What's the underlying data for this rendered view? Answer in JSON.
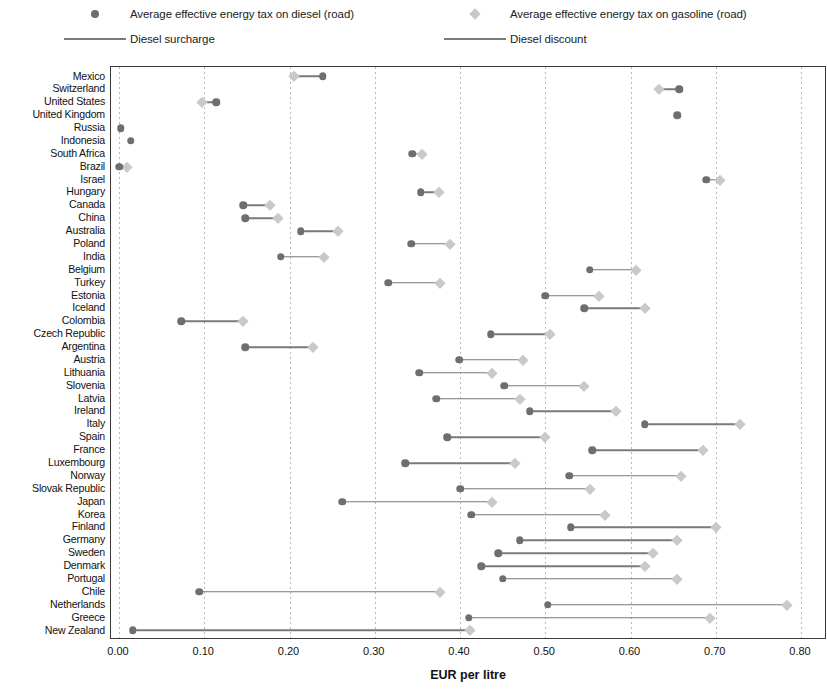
{
  "legend": {
    "items": [
      {
        "marker": "circle-dark",
        "label": "Average effective energy tax on diesel (road)"
      },
      {
        "marker": "diamond-light",
        "label": "Average effective energy tax on gasoline (road)"
      },
      {
        "marker": "line",
        "label": "Diesel surcharge"
      },
      {
        "marker": "line",
        "label": "Diesel discount"
      }
    ]
  },
  "colors": {
    "diesel_marker": "#6e6e6e",
    "gasoline_marker": "#c9c9c9",
    "connector": "#7a7a7a",
    "frame": "#3a3a3a",
    "gridline": "#b9b9b9"
  },
  "chart_data": {
    "type": "scatter",
    "title": "",
    "xlabel": "EUR per litre",
    "ylabel": "",
    "xlim": [
      0.0,
      0.8
    ],
    "xticks": [
      "0.00",
      "0.10",
      "0.20",
      "0.30",
      "0.40",
      "0.50",
      "0.60",
      "0.70",
      "0.80"
    ],
    "xtick_values": [
      0.0,
      0.1,
      0.2,
      0.3,
      0.4,
      0.5,
      0.6,
      0.7,
      0.8
    ],
    "grid": "vertical-dotted",
    "legend_position": "top",
    "series": [
      {
        "name": "Average effective energy tax on diesel (road)",
        "marker": "circle",
        "color": "#6e6e6e"
      },
      {
        "name": "Average effective energy tax on gasoline (road)",
        "marker": "diamond",
        "color": "#c9c9c9"
      }
    ],
    "categories": [
      "Mexico",
      "Switzerland",
      "United States",
      "United Kingdom",
      "Russia",
      "Indonesia",
      "South Africa",
      "Brazil",
      "Israel",
      "Hungary",
      "Canada",
      "China",
      "Australia",
      "Poland",
      "India",
      "Belgium",
      "Turkey",
      "Estonia",
      "Iceland",
      "Colombia",
      "Czech Republic",
      "Argentina",
      "Austria",
      "Lithuania",
      "Slovenia",
      "Latvia",
      "Ireland",
      "Italy",
      "Spain",
      "France",
      "Luxembourg",
      "Norway",
      "Slovak Republic",
      "Japan",
      "Korea",
      "Finland",
      "Germany",
      "Sweden",
      "Denmark",
      "Portugal",
      "Chile",
      "Netherlands",
      "Greece",
      "New Zealand"
    ],
    "rows": [
      {
        "country": "Mexico",
        "diesel": 0.239,
        "gasoline": 0.205,
        "relation": "surcharge"
      },
      {
        "country": "Switzerland",
        "diesel": 0.657,
        "gasoline": 0.633,
        "relation": "surcharge"
      },
      {
        "country": "United States",
        "diesel": 0.114,
        "gasoline": 0.097,
        "relation": "surcharge"
      },
      {
        "country": "United Kingdom",
        "diesel": 0.655,
        "gasoline": null,
        "relation": "equal"
      },
      {
        "country": "Russia",
        "diesel": 0.002,
        "gasoline": null,
        "relation": "none"
      },
      {
        "country": "Indonesia",
        "diesel": 0.014,
        "gasoline": null,
        "relation": "none"
      },
      {
        "country": "South Africa",
        "diesel": 0.344,
        "gasoline": 0.356,
        "relation": "discount"
      },
      {
        "country": "Brazil",
        "diesel": 0.0,
        "gasoline": 0.009,
        "relation": "discount"
      },
      {
        "country": "Israel",
        "diesel": 0.689,
        "gasoline": 0.705,
        "relation": "discount"
      },
      {
        "country": "Hungary",
        "diesel": 0.354,
        "gasoline": 0.375,
        "relation": "discount"
      },
      {
        "country": "Canada",
        "diesel": 0.146,
        "gasoline": 0.177,
        "relation": "discount"
      },
      {
        "country": "China",
        "diesel": 0.148,
        "gasoline": 0.186,
        "relation": "discount"
      },
      {
        "country": "Australia",
        "diesel": 0.213,
        "gasoline": 0.257,
        "relation": "discount"
      },
      {
        "country": "Poland",
        "diesel": 0.343,
        "gasoline": 0.388,
        "relation": "discount"
      },
      {
        "country": "India",
        "diesel": 0.19,
        "gasoline": 0.24,
        "relation": "discount"
      },
      {
        "country": "Belgium",
        "diesel": 0.552,
        "gasoline": 0.607,
        "relation": "discount"
      },
      {
        "country": "Turkey",
        "diesel": 0.316,
        "gasoline": 0.377,
        "relation": "discount"
      },
      {
        "country": "Estonia",
        "diesel": 0.5,
        "gasoline": 0.563,
        "relation": "discount"
      },
      {
        "country": "Iceland",
        "diesel": 0.546,
        "gasoline": 0.617,
        "relation": "discount"
      },
      {
        "country": "Colombia",
        "diesel": 0.073,
        "gasoline": 0.145,
        "relation": "discount"
      },
      {
        "country": "Czech Republic",
        "diesel": 0.436,
        "gasoline": 0.506,
        "relation": "discount"
      },
      {
        "country": "Argentina",
        "diesel": 0.148,
        "gasoline": 0.227,
        "relation": "discount"
      },
      {
        "country": "Austria",
        "diesel": 0.399,
        "gasoline": 0.474,
        "relation": "discount"
      },
      {
        "country": "Lithuania",
        "diesel": 0.352,
        "gasoline": 0.437,
        "relation": "discount"
      },
      {
        "country": "Slovenia",
        "diesel": 0.452,
        "gasoline": 0.545,
        "relation": "discount"
      },
      {
        "country": "Latvia",
        "diesel": 0.372,
        "gasoline": 0.47,
        "relation": "discount"
      },
      {
        "country": "Ireland",
        "diesel": 0.482,
        "gasoline": 0.583,
        "relation": "discount"
      },
      {
        "country": "Italy",
        "diesel": 0.617,
        "gasoline": 0.728,
        "relation": "discount"
      },
      {
        "country": "Spain",
        "diesel": 0.385,
        "gasoline": 0.5,
        "relation": "discount"
      },
      {
        "country": "France",
        "diesel": 0.555,
        "gasoline": 0.685,
        "relation": "discount"
      },
      {
        "country": "Luxembourg",
        "diesel": 0.336,
        "gasoline": 0.465,
        "relation": "discount"
      },
      {
        "country": "Norway",
        "diesel": 0.528,
        "gasoline": 0.659,
        "relation": "discount"
      },
      {
        "country": "Slovak Republic",
        "diesel": 0.4,
        "gasoline": 0.553,
        "relation": "discount"
      },
      {
        "country": "Japan",
        "diesel": 0.262,
        "gasoline": 0.438,
        "relation": "discount"
      },
      {
        "country": "Korea",
        "diesel": 0.413,
        "gasoline": 0.57,
        "relation": "discount"
      },
      {
        "country": "Finland",
        "diesel": 0.53,
        "gasoline": 0.7,
        "relation": "discount"
      },
      {
        "country": "Germany",
        "diesel": 0.47,
        "gasoline": 0.654,
        "relation": "discount"
      },
      {
        "country": "Sweden",
        "diesel": 0.445,
        "gasoline": 0.626,
        "relation": "discount"
      },
      {
        "country": "Denmark",
        "diesel": 0.425,
        "gasoline": 0.617,
        "relation": "discount"
      },
      {
        "country": "Portugal",
        "diesel": 0.45,
        "gasoline": 0.655,
        "relation": "discount"
      },
      {
        "country": "Chile",
        "diesel": 0.094,
        "gasoline": 0.377,
        "relation": "discount"
      },
      {
        "country": "Netherlands",
        "diesel": 0.503,
        "gasoline": 0.783,
        "relation": "discount"
      },
      {
        "country": "Greece",
        "diesel": 0.41,
        "gasoline": 0.693,
        "relation": "discount"
      },
      {
        "country": "New Zealand",
        "diesel": 0.016,
        "gasoline": 0.412,
        "relation": "discount"
      }
    ]
  }
}
